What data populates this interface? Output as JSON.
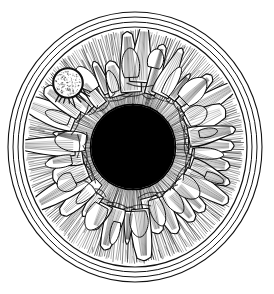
{
  "image": {
    "title": "Human Iris Anatomical Engraving",
    "subject": "eye-iris",
    "style": "pen-and-ink line engraving",
    "medium": "black line art on white ground",
    "background_color": "#ffffff",
    "ink_color": "#0a0a0a",
    "canvas": {
      "width": 274,
      "height": 294
    }
  },
  "structure": {
    "limbus": {
      "label": "limbus",
      "description": "outer corneal boundary drawn as concentric thin rings",
      "center": {
        "cx": 135,
        "cy": 147
      },
      "ring_radii_x": [
        127,
        122,
        117,
        112
      ],
      "ring_radii_y": [
        135,
        130,
        125,
        120
      ],
      "ring_count": 4,
      "stroke_color": "#111111",
      "stroke_width": 1.1
    },
    "iris_field": {
      "label": "iris stroma",
      "description": "dense radial fiber hatching filling the annulus between collarette and limbus",
      "outer_radius_x": 110,
      "outer_radius_y": 118,
      "inner_radius": 42,
      "fiber_count": 300,
      "stroke_color": "#141414"
    },
    "collarette": {
      "label": "collarette",
      "description": "scalloped ridge of crypt loops encircling the pupil",
      "mean_radius": 74,
      "crypt_count": 34
    },
    "crypts": {
      "label": "crypts of Fuchs",
      "description": "teardrop and finger shaped lacunae outlined in heavy ink over the hatching",
      "count": 34,
      "outline_color": "#0d0d0d"
    },
    "pupil": {
      "label": "pupil",
      "description": "solid black central aperture",
      "cx": 133,
      "cy": 147,
      "radius": 42,
      "fill_color": "#000000"
    },
    "lacuna_highlight": {
      "label": "lacuna highlight",
      "description": "pale stippled round lacuna in the upper-left iris quadrant with dark rim",
      "cx": 68,
      "cy": 83,
      "radius": 14,
      "fill_color": "#fbfbfb",
      "rim_color": "#101010",
      "stipple_dots": 150
    }
  },
  "palette": {
    "ink": "#0a0a0a",
    "paper": "#ffffff",
    "pupil": "#000000",
    "mid_tone": "#2a2a2a",
    "highlight": "#fbfbfb"
  }
}
